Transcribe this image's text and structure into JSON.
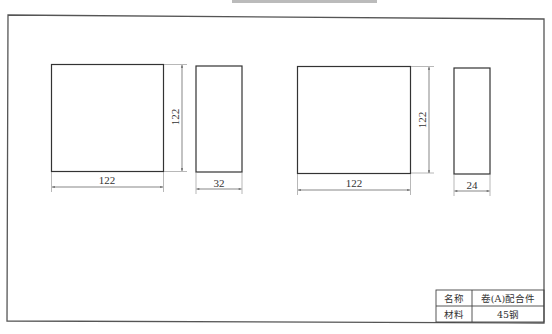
{
  "drawing": {
    "header_strip": "",
    "parts": [
      {
        "id": "part-1-front",
        "width_label": "122",
        "height_label": "122"
      },
      {
        "id": "part-1-side",
        "width_label": "32"
      },
      {
        "id": "part-2-front",
        "width_label": "122",
        "height_label": "122"
      },
      {
        "id": "part-2-side",
        "width_label": "24"
      }
    ],
    "title_block": {
      "name_label": "名称",
      "name_value": "卷(A)配合件",
      "material_label": "材料",
      "material_value": "45钢"
    }
  }
}
